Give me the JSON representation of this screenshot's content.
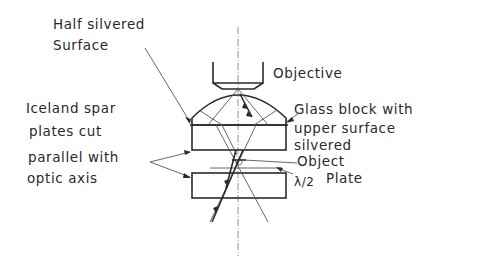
{
  "diagram": {
    "type": "optical-schematic",
    "labels": {
      "half_silvered_line1": "Half silvered",
      "half_silvered_line2": "Surface",
      "objective": "Objective",
      "iceland_line1": "Iceland spar",
      "iceland_line2": "plates cut",
      "iceland_line3": "parallel with",
      "iceland_line4": "optic axis",
      "glass_line1": "Glass block with",
      "glass_line2": "upper surface",
      "glass_line3": "silvered",
      "object": "Object",
      "half_wave_symbol": "λ/2",
      "half_wave_label": "Plate"
    },
    "components": [
      "objective",
      "glass-block-dome",
      "iceland-spar-plate-upper",
      "object",
      "half-wave-plate",
      "iceland-spar-plate-lower",
      "optical-axis",
      "light-rays"
    ],
    "colors": {
      "ink": "#2a2a2a",
      "background": "#ffffff"
    }
  }
}
